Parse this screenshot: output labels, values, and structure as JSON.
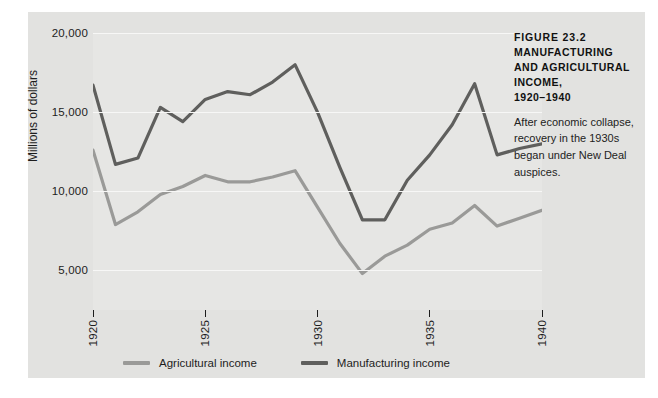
{
  "caption": {
    "figure_number": "FIGURE 23.2",
    "title": "MANUFACTURING AND AGRICULTURAL INCOME,",
    "years": "1920–1940",
    "body": "After economic collapse, recovery in the 1930s began under New Deal auspices."
  },
  "legend": {
    "items": [
      {
        "label": "Agricultural income",
        "color": "#9a9a98"
      },
      {
        "label": "Manufacturing income",
        "color": "#5f5f5d"
      }
    ]
  },
  "axes": {
    "y_title": "Millions of dollars",
    "y_ticks": [
      "20,000",
      "15,000",
      "10,000",
      "5,000"
    ],
    "x_ticks": [
      "1920",
      "1925",
      "1930",
      "1935",
      "1940"
    ]
  },
  "chart_data": {
    "type": "line",
    "title": "MANUFACTURING AND AGRICULTURAL INCOME, 1920–1940",
    "subtitle": "After economic collapse, recovery in the 1930s began under New Deal auspices.",
    "xlabel": "",
    "ylabel": "Millions of dollars",
    "xlim": [
      1920,
      1940
    ],
    "ylim": [
      2500,
      20000
    ],
    "yticks": [
      5000,
      10000,
      15000,
      20000
    ],
    "xticks": [
      1920,
      1925,
      1930,
      1935,
      1940
    ],
    "ytick_labels": [
      "5,000",
      "10,000",
      "15,000",
      "20,000"
    ],
    "xtick_labels": [
      "1920",
      "1925",
      "1930",
      "1935",
      "1940"
    ],
    "grid": "horizontal",
    "legend_position": "bottom",
    "x": [
      1920,
      1921,
      1922,
      1923,
      1924,
      1925,
      1926,
      1927,
      1928,
      1929,
      1930,
      1931,
      1932,
      1933,
      1934,
      1935,
      1936,
      1937,
      1938,
      1939,
      1940
    ],
    "series": [
      {
        "name": "Manufacturing income",
        "color": "#5f5f5d",
        "values": [
          16700,
          11700,
          12100,
          15300,
          14400,
          15800,
          16300,
          16100,
          16900,
          18000,
          15000,
          11500,
          8200,
          8200,
          10700,
          12300,
          14200,
          16800,
          12300,
          12700,
          13000
        ]
      },
      {
        "name": "Agricultural income",
        "color": "#9a9a98",
        "values": [
          12600,
          7900,
          8700,
          9800,
          10300,
          11000,
          10600,
          10600,
          10900,
          11300,
          9000,
          6700,
          4800,
          5900,
          6600,
          7600,
          8000,
          9100,
          7800,
          8300,
          8800
        ]
      }
    ]
  }
}
